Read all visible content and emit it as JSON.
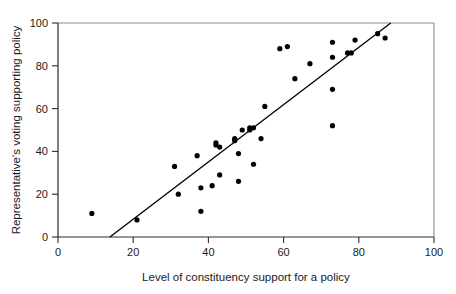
{
  "chart_data": {
    "type": "scatter",
    "title": "",
    "xlabel": "Level of constituency support for a policy",
    "ylabel": "Representative's voting supporting policy",
    "xlim": [
      0,
      100
    ],
    "ylim": [
      0,
      100
    ],
    "xticks": [
      0,
      20,
      40,
      60,
      80,
      100
    ],
    "yticks": [
      0,
      20,
      40,
      60,
      80,
      100
    ],
    "xtick_labels": [
      "0",
      "20",
      "40",
      "60",
      "80",
      "100"
    ],
    "ytick_labels": [
      "0",
      "20",
      "40",
      "60",
      "80",
      "100"
    ],
    "grid": false,
    "legend": null,
    "marker": "filled-circle",
    "marker_color": "#000000",
    "points": [
      [
        9,
        11
      ],
      [
        21,
        8
      ],
      [
        31,
        33
      ],
      [
        32,
        20
      ],
      [
        37,
        38
      ],
      [
        38,
        23
      ],
      [
        38,
        12
      ],
      [
        41,
        24
      ],
      [
        42,
        44
      ],
      [
        42,
        43
      ],
      [
        43,
        42
      ],
      [
        43,
        29
      ],
      [
        47,
        46
      ],
      [
        47,
        45
      ],
      [
        48,
        39
      ],
      [
        48,
        26
      ],
      [
        49,
        50
      ],
      [
        51,
        50
      ],
      [
        51,
        51
      ],
      [
        52,
        51
      ],
      [
        52,
        34
      ],
      [
        54,
        46
      ],
      [
        55,
        61
      ],
      [
        59,
        88
      ],
      [
        61,
        89
      ],
      [
        63,
        74
      ],
      [
        67,
        81
      ],
      [
        73,
        91
      ],
      [
        73,
        84
      ],
      [
        73,
        69
      ],
      [
        73,
        52
      ],
      [
        77,
        86
      ],
      [
        78,
        86
      ],
      [
        79,
        92
      ],
      [
        85,
        95
      ],
      [
        87,
        93
      ]
    ],
    "trend_line": {
      "type": "linear-fit",
      "x_start": 13.8,
      "y_start": 0,
      "x_end": 88.5,
      "y_end": 100,
      "slope": 1.34,
      "intercept": -18.5
    }
  }
}
